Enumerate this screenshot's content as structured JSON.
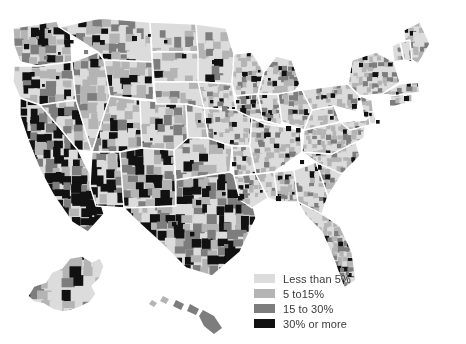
{
  "figure": {
    "type": "choropleth-map",
    "region": "United States (counties, with Alaska and Hawaii insets)",
    "background_color": "#ffffff",
    "border_color": "#ffffff",
    "title": ""
  },
  "legend": {
    "position": "bottom-right",
    "text_color": "#3a3a3a",
    "items": [
      {
        "label": "Less than 5%",
        "color": "#dcdcdc",
        "min": 0,
        "max": 5
      },
      {
        "label": "5 to15%",
        "color": "#b4b4b4",
        "min": 5,
        "max": 15
      },
      {
        "label": "15 to 30%",
        "color": "#7d7d7d",
        "min": 15,
        "max": 30
      },
      {
        "label": "30% or more",
        "color": "#111111",
        "min": 30,
        "max": 100
      }
    ]
  },
  "chart_data": {
    "type": "heatmap",
    "subtype": "choropleth",
    "title": "",
    "xlabel": "",
    "ylabel": "",
    "legend_position": "bottom-right",
    "grid": false,
    "classes": [
      "Less than 5%",
      "5 to15%",
      "15 to 30%",
      "30% or more"
    ],
    "class_colors": [
      "#dcdcdc",
      "#b4b4b4",
      "#7d7d7d",
      "#111111"
    ],
    "regional_summary": [
      {
        "region": "California",
        "dominant_class": "30% or more"
      },
      {
        "region": "Southwest / Arizona",
        "dominant_class": "30% or more"
      },
      {
        "region": "South Texas border",
        "dominant_class": "30% or more"
      },
      {
        "region": "South Florida",
        "dominant_class": "30% or more"
      },
      {
        "region": "Pacific Northwest",
        "dominant_class": "5 to15%"
      },
      {
        "region": "Great Plains",
        "dominant_class": "Less than 5%"
      },
      {
        "region": "Midwest",
        "dominant_class": "Less than 5%"
      },
      {
        "region": "Southeast",
        "dominant_class": "Less than 5%"
      },
      {
        "region": "Appalachia",
        "dominant_class": "Less than 5%"
      },
      {
        "region": "Northeast",
        "dominant_class": "Less than 5%"
      },
      {
        "region": "Alaska",
        "dominant_class": "5 to15%"
      },
      {
        "region": "Hawaii",
        "dominant_class": "15 to 30%"
      }
    ]
  }
}
